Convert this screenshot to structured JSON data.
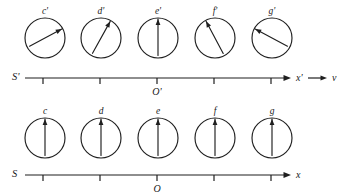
{
  "figure": {
    "background_color": "#ffffff",
    "ink_color": "#1f1f1f"
  },
  "frames": [
    {
      "id": "primed",
      "frame_label": "S'",
      "axis_label": "x'",
      "origin_label": "O'",
      "velocity_label": "v",
      "has_velocity_arrow": true,
      "axis_y": 78,
      "axis_start_x": 25,
      "axis_end_x": 291,
      "clock_center_y": 38,
      "clock_radius": 20,
      "tick_positions": [
        43,
        100,
        157,
        214,
        271
      ],
      "clocks": [
        {
          "label": "c'",
          "cx": 45,
          "hand_angle_deg": 28,
          "hand_length": 19
        },
        {
          "label": "d'",
          "cx": 101,
          "hand_angle_deg": 61,
          "hand_length": 19
        },
        {
          "label": "e'",
          "cx": 158,
          "hand_angle_deg": 90,
          "hand_length": 19
        },
        {
          "label": "f'",
          "cx": 215,
          "hand_angle_deg": 118,
          "hand_length": 19
        },
        {
          "label": "g'",
          "cx": 272,
          "hand_angle_deg": 152,
          "hand_length": 19
        }
      ]
    },
    {
      "id": "unprimed",
      "frame_label": "S",
      "axis_label": "x",
      "origin_label": "O",
      "velocity_label": "",
      "has_velocity_arrow": false,
      "axis_y": 175,
      "axis_start_x": 25,
      "axis_end_x": 291,
      "clock_center_y": 138,
      "clock_radius": 20,
      "tick_positions": [
        43,
        100,
        157,
        214,
        271
      ],
      "clocks": [
        {
          "label": "c",
          "cx": 45,
          "hand_angle_deg": 90,
          "hand_length": 19
        },
        {
          "label": "d",
          "cx": 101,
          "hand_angle_deg": 90,
          "hand_length": 19
        },
        {
          "label": "e",
          "cx": 158,
          "hand_angle_deg": 90,
          "hand_length": 19
        },
        {
          "label": "f",
          "cx": 215,
          "hand_angle_deg": 90,
          "hand_length": 19
        },
        {
          "label": "g",
          "cx": 272,
          "hand_angle_deg": 90,
          "hand_length": 19
        }
      ]
    }
  ]
}
